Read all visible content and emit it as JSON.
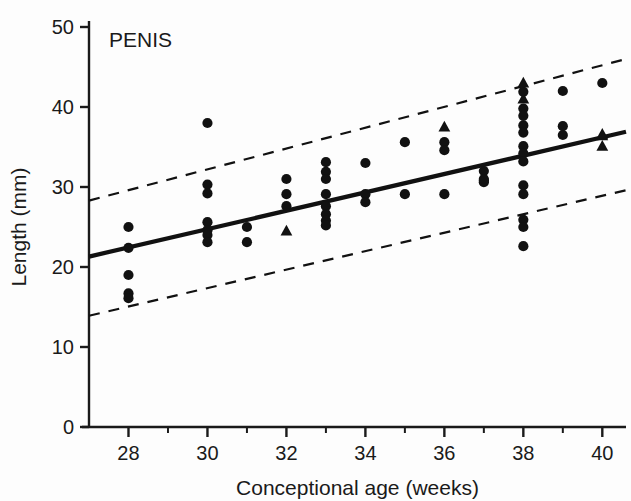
{
  "chart_data": {
    "type": "scatter",
    "title": "PENIS",
    "xlabel": "Conceptional age (weeks)",
    "ylabel": "Length (mm)",
    "xlim": [
      27,
      40.6
    ],
    "ylim": [
      0,
      50
    ],
    "xticks": [
      28,
      30,
      32,
      34,
      36,
      38,
      40
    ],
    "xticklabels": [
      "28",
      "30",
      "32",
      "34",
      "36",
      "38",
      "40"
    ],
    "xminorticks": [
      29,
      31,
      33,
      35,
      37,
      39
    ],
    "yticks": [
      0,
      10,
      20,
      30,
      40,
      50
    ],
    "yticklabels": [
      "0",
      "10",
      "20",
      "30",
      "40",
      "50"
    ],
    "grid": false,
    "legend": null,
    "series": [
      {
        "name": "observations-circle",
        "marker": "circle",
        "points": [
          [
            28.0,
            25.0
          ],
          [
            28.0,
            22.4
          ],
          [
            28.0,
            19.0
          ],
          [
            28.0,
            16.7
          ],
          [
            28.0,
            16.1
          ],
          [
            30.0,
            38.0
          ],
          [
            30.0,
            30.3
          ],
          [
            30.0,
            29.2
          ],
          [
            30.0,
            25.6
          ],
          [
            30.0,
            24.6
          ],
          [
            30.0,
            24.0
          ],
          [
            30.0,
            23.1
          ],
          [
            31.0,
            25.0
          ],
          [
            31.0,
            23.1
          ],
          [
            32.0,
            31.0
          ],
          [
            32.0,
            29.1
          ],
          [
            32.0,
            27.6
          ],
          [
            33.0,
            33.1
          ],
          [
            33.0,
            31.9
          ],
          [
            33.0,
            31.0
          ],
          [
            33.0,
            29.1
          ],
          [
            33.0,
            27.6
          ],
          [
            33.0,
            26.6
          ],
          [
            33.0,
            25.8
          ],
          [
            33.0,
            25.2
          ],
          [
            34.0,
            33.0
          ],
          [
            34.0,
            29.1
          ],
          [
            34.0,
            28.1
          ],
          [
            35.0,
            35.6
          ],
          [
            35.0,
            29.1
          ],
          [
            36.0,
            35.6
          ],
          [
            36.0,
            34.6
          ],
          [
            36.0,
            29.1
          ],
          [
            37.0,
            32.0
          ],
          [
            37.0,
            30.6
          ],
          [
            37.0,
            30.8
          ],
          [
            37.0,
            31.0
          ],
          [
            38.0,
            41.9
          ],
          [
            38.0,
            39.8
          ],
          [
            38.0,
            38.9
          ],
          [
            38.0,
            37.7
          ],
          [
            38.0,
            36.8
          ],
          [
            38.0,
            35.1
          ],
          [
            38.0,
            34.2
          ],
          [
            38.0,
            33.2
          ],
          [
            38.0,
            30.2
          ],
          [
            38.0,
            29.1
          ],
          [
            38.0,
            25.9
          ],
          [
            38.0,
            25.0
          ],
          [
            38.0,
            22.6
          ],
          [
            39.0,
            42.0
          ],
          [
            39.0,
            37.6
          ],
          [
            39.0,
            36.5
          ],
          [
            40.0,
            43.0
          ]
        ]
      },
      {
        "name": "observations-triangle",
        "marker": "triangle",
        "points": [
          [
            32.0,
            24.5
          ],
          [
            36.0,
            37.5
          ],
          [
            38.0,
            43.0
          ],
          [
            38.0,
            41.0
          ],
          [
            40.0,
            36.6
          ],
          [
            40.0,
            36.4
          ],
          [
            40.0,
            35.1
          ]
        ]
      }
    ],
    "fit_line": {
      "name": "regression-line",
      "style": "solid",
      "x": [
        27,
        40.6
      ],
      "y": [
        21.3,
        36.9
      ]
    },
    "bounds": [
      {
        "name": "upper-confidence-band",
        "style": "dashed",
        "x": [
          27,
          40.6
        ],
        "y": [
          28.3,
          46.0
        ]
      },
      {
        "name": "lower-confidence-band",
        "style": "dashed",
        "x": [
          27,
          40.6
        ],
        "y": [
          13.9,
          29.6
        ]
      }
    ],
    "colors": {
      "marker": "#111111",
      "fit_line": "#111111",
      "band": "#111111",
      "axis": "#1a1a1a",
      "background": "#fdfdfd"
    }
  }
}
